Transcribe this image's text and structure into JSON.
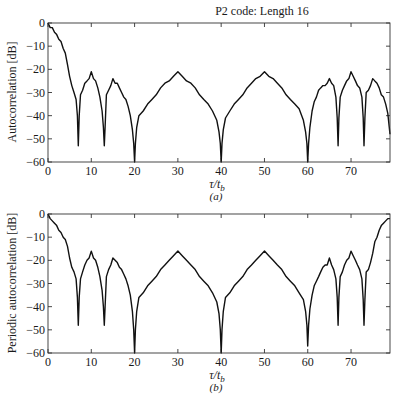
{
  "figure": {
    "title": "P2 code: Length 16"
  },
  "chart_data": [
    {
      "type": "line",
      "panel": "(a)",
      "title": "P2 code: Length 16",
      "xlabel": "τ/t_b",
      "xlabel_main": "τ/t",
      "xlabel_sub": "b",
      "ylabel": "Autocorrelation [dB]",
      "xlim": [
        0,
        79
      ],
      "ylim": [
        -60,
        0
      ],
      "xticks": [
        0,
        10,
        20,
        30,
        40,
        50,
        60,
        70
      ],
      "yticks": [
        0,
        -10,
        -20,
        -30,
        -40,
        -50,
        -60
      ],
      "ytick_labels": [
        "0",
        "−10",
        "−20",
        "−30",
        "−40",
        "−50",
        "−60"
      ],
      "grid": false,
      "x": [
        0,
        0.5,
        1,
        1.5,
        2,
        2.5,
        3,
        3.5,
        4,
        4.5,
        5,
        5.5,
        6,
        6.5,
        6.8,
        7,
        7.2,
        7.5,
        8,
        8.5,
        9,
        9.5,
        10,
        10.5,
        11,
        11.5,
        12,
        12.5,
        12.8,
        13,
        13.2,
        13.5,
        14,
        14.5,
        15,
        15.5,
        16,
        16.5,
        17,
        17.5,
        18,
        18.5,
        19,
        19.5,
        19.8,
        20,
        20.2,
        20.5,
        21,
        22,
        23,
        24,
        25,
        26,
        27,
        28,
        29,
        30,
        31,
        32,
        33,
        34,
        35,
        36,
        37,
        38,
        39,
        39.5,
        39.8,
        40,
        40.2,
        40.5,
        41,
        42,
        43,
        44,
        45,
        46,
        47,
        48,
        49,
        50,
        51,
        52,
        53,
        54,
        55,
        56,
        57,
        58,
        59,
        59.5,
        59.8,
        60,
        60.2,
        60.5,
        61,
        61.5,
        62,
        62.5,
        63,
        63.5,
        64,
        64.5,
        65,
        65.5,
        66,
        66.5,
        66.8,
        67,
        67.2,
        67.5,
        68,
        68.5,
        69,
        69.5,
        70,
        70.5,
        71,
        71.5,
        72,
        72.5,
        72.8,
        73,
        73.2,
        73.5,
        74,
        74.5,
        75,
        75.5,
        76,
        76.5,
        77,
        77.5,
        78,
        78.5,
        79
      ],
      "y": [
        0,
        -2,
        -2,
        -4,
        -5,
        -7,
        -8,
        -11,
        -13,
        -18,
        -23,
        -27,
        -30,
        -33,
        -40,
        -53,
        -40,
        -31,
        -29,
        -26,
        -25,
        -24,
        -21,
        -24,
        -25,
        -28,
        -32,
        -38,
        -45,
        -53,
        -45,
        -31,
        -29,
        -27,
        -24,
        -26,
        -26,
        -28,
        -30,
        -32,
        -33,
        -36,
        -40,
        -46,
        -52,
        -60,
        -52,
        -45,
        -40,
        -38,
        -35,
        -33,
        -31,
        -28,
        -26,
        -25,
        -23,
        -21,
        -23,
        -25,
        -26,
        -28,
        -31,
        -33,
        -35,
        -38,
        -42,
        -47,
        -52,
        -60,
        -52,
        -46,
        -41,
        -38,
        -35,
        -33,
        -31,
        -28,
        -26,
        -24,
        -23,
        -21,
        -23,
        -24,
        -26,
        -28,
        -31,
        -33,
        -35,
        -37,
        -42,
        -47,
        -52,
        -60,
        -52,
        -45,
        -38,
        -34,
        -32,
        -29,
        -28,
        -27,
        -27,
        -26,
        -24,
        -26,
        -27,
        -32,
        -41,
        -53,
        -41,
        -32,
        -29,
        -27,
        -25,
        -24,
        -21,
        -23,
        -25,
        -27,
        -28,
        -32,
        -41,
        -53,
        -41,
        -30,
        -29,
        -27,
        -24,
        -25,
        -26,
        -28,
        -31,
        -32,
        -35,
        -39,
        -48
      ]
    },
    {
      "type": "line",
      "panel": "(b)",
      "title": "",
      "xlabel": "τ/t_b",
      "xlabel_main": "τ/t",
      "xlabel_sub": "b",
      "ylabel": "Periodic autocorrelation [dB]",
      "xlim": [
        0,
        79
      ],
      "ylim": [
        -60,
        0
      ],
      "xticks": [
        0,
        10,
        20,
        30,
        40,
        50,
        60,
        70
      ],
      "yticks": [
        0,
        -10,
        -20,
        -30,
        -40,
        -50,
        -60
      ],
      "ytick_labels": [
        "0",
        "−10",
        "−20",
        "−30",
        "−40",
        "−50",
        "−60"
      ],
      "grid": false,
      "x": [
        0,
        0.5,
        1,
        1.5,
        2,
        2.5,
        3,
        3.5,
        4,
        4.5,
        5,
        5.5,
        6,
        6.5,
        6.8,
        7,
        7.2,
        7.5,
        8,
        8.5,
        9,
        9.5,
        10,
        10.5,
        11,
        11.5,
        12,
        12.5,
        12.8,
        13,
        13.2,
        13.5,
        14,
        14.5,
        15,
        15.5,
        16,
        16.5,
        17,
        17.5,
        18,
        18.5,
        19,
        19.5,
        19.8,
        20,
        20.2,
        20.5,
        21,
        22,
        23,
        24,
        25,
        26,
        27,
        28,
        29,
        30,
        31,
        32,
        33,
        34,
        35,
        36,
        37,
        38,
        39,
        39.5,
        39.8,
        40,
        40.2,
        40.5,
        41,
        42,
        43,
        44,
        45,
        46,
        47,
        48,
        49,
        50,
        51,
        52,
        53,
        54,
        55,
        56,
        57,
        58,
        59,
        59.5,
        59.8,
        60,
        60.2,
        60.5,
        61,
        61.5,
        62,
        62.5,
        63,
        63.5,
        64,
        64.5,
        65,
        65.5,
        66,
        66.5,
        66.8,
        67,
        67.2,
        67.5,
        68,
        68.5,
        69,
        69.5,
        70,
        70.5,
        71,
        71.5,
        72,
        72.5,
        72.8,
        73,
        73.2,
        73.5,
        74,
        74.5,
        75,
        75.5,
        76,
        76.5,
        77,
        77.5,
        78,
        78.5,
        79
      ],
      "y": [
        0,
        -2,
        -3,
        -4,
        -5,
        -7,
        -8,
        -10,
        -11,
        -14,
        -19,
        -23,
        -25,
        -28,
        -36,
        -48,
        -36,
        -28,
        -25,
        -22,
        -20,
        -19,
        -16,
        -19,
        -20,
        -23,
        -27,
        -33,
        -40,
        -48,
        -40,
        -27,
        -24,
        -22,
        -19,
        -20,
        -21,
        -23,
        -24,
        -26,
        -28,
        -31,
        -35,
        -42,
        -50,
        -60,
        -50,
        -42,
        -36,
        -34,
        -31,
        -29,
        -27,
        -24,
        -22,
        -20,
        -18,
        -16,
        -18,
        -20,
        -22,
        -24,
        -27,
        -29,
        -31,
        -34,
        -38,
        -43,
        -50,
        -60,
        -50,
        -42,
        -36,
        -34,
        -31,
        -29,
        -27,
        -24,
        -22,
        -20,
        -18,
        -16,
        -18,
        -20,
        -22,
        -24,
        -27,
        -29,
        -31,
        -34,
        -37,
        -42,
        -48,
        -57,
        -48,
        -41,
        -35,
        -31,
        -29,
        -27,
        -25,
        -23,
        -22,
        -22,
        -19,
        -22,
        -24,
        -28,
        -36,
        -48,
        -36,
        -27,
        -25,
        -22,
        -20,
        -19,
        -16,
        -18,
        -20,
        -22,
        -24,
        -28,
        -37,
        -48,
        -37,
        -25,
        -24,
        -21,
        -17,
        -12,
        -10,
        -7,
        -5,
        -4,
        -3,
        -2,
        -2
      ]
    }
  ]
}
